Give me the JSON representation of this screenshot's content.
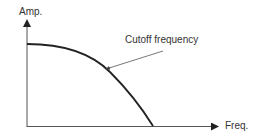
{
  "diagram": {
    "y_axis_label": "Amp.",
    "x_axis_label": "Freq.",
    "annotation": "Cutoff frequency",
    "curve": "low-pass frequency response falling from max amplitude to zero",
    "colors": {
      "stroke": "#333333",
      "background": "#ffffff"
    }
  }
}
